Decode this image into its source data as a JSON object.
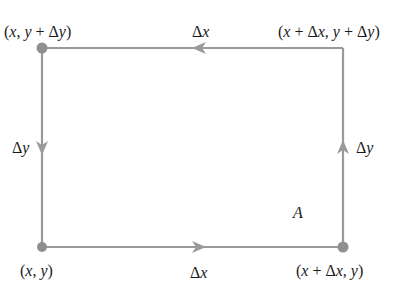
{
  "diagram": {
    "type": "rectangular-path",
    "colors": {
      "line": "#9a9a9a",
      "point": "#8f8f8f",
      "text": "#1a1a1a",
      "background": "#ffffff"
    },
    "vertices": {
      "top_left": "(x, y + Δy)",
      "top_right": "(x + Δx, y + Δy)",
      "bottom_left": "(x, y)",
      "bottom_right": "(x + Δx, y)"
    },
    "edges": {
      "top": "Δx",
      "bottom": "Δx",
      "left": "Δy",
      "right": "Δy"
    },
    "area_label": "A"
  }
}
